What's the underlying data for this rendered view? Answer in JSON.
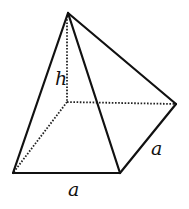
{
  "diagram": {
    "type": "square-pyramid",
    "colors": {
      "stroke": "#111111",
      "background": "#ffffff"
    },
    "vertices": {
      "apex": [
        68,
        13
      ],
      "base_back_left": [
        67,
        102
      ],
      "base_back_right": [
        176,
        104
      ],
      "base_front_left": [
        13,
        173
      ],
      "base_front_right": [
        120,
        173
      ]
    },
    "labels": {
      "height": "h",
      "side_right": "a",
      "side_bottom": "a"
    }
  }
}
